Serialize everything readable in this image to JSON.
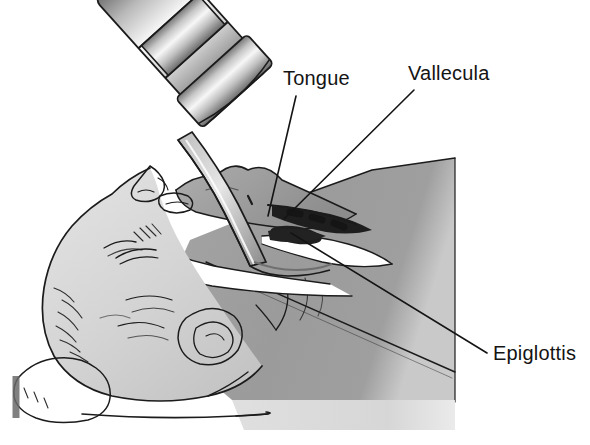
{
  "figure": {
    "background_color": "#ffffff",
    "ink_color": "#1b1b1b",
    "width": 590,
    "height": 445
  },
  "labels": [
    {
      "id": "tongue",
      "text": "Tongue",
      "x": 283,
      "y": 85,
      "leader": {
        "from_x": 296,
        "from_y": 96,
        "to_x": 268,
        "to_y": 216
      }
    },
    {
      "id": "vallecula",
      "text": "Vallecula",
      "x": 408,
      "y": 80,
      "leader": {
        "from_x": 414,
        "from_y": 90,
        "to_x": 284,
        "to_y": 219
      }
    },
    {
      "id": "epiglottis",
      "text": "Epiglottis",
      "x": 493,
      "y": 360,
      "leader": {
        "from_x": 487,
        "from_y": 353,
        "to_x": 291,
        "to_y": 233
      }
    }
  ],
  "anatomy_parts": [
    {
      "id": "head-face",
      "name": "head-and-face",
      "tone": "#d6d6d6"
    },
    {
      "id": "ear",
      "name": "ear",
      "tone": "#d0d0d0"
    },
    {
      "id": "nose",
      "name": "nose",
      "tone": "#cccccc"
    },
    {
      "id": "eye",
      "name": "closed-eye",
      "tone": "#cfcfcf"
    },
    {
      "id": "neck",
      "name": "neck",
      "tone": "#b5b5b5"
    },
    {
      "id": "torso",
      "name": "chest-and-shoulder",
      "tone": "#9a9a9a"
    },
    {
      "id": "tongue-body",
      "name": "tongue",
      "tone": "#9d9d9d"
    },
    {
      "id": "vallecula-pocket",
      "name": "vallecula",
      "tone": "#1e1e1e"
    },
    {
      "id": "epiglottis-flap",
      "name": "epiglottis",
      "tone": "#222222"
    },
    {
      "id": "pharynx-airway",
      "name": "pharyngeal-airway",
      "tone": "#ffffff"
    },
    {
      "id": "pillow",
      "name": "head-pillow",
      "tone": "#f2f2f2"
    }
  ],
  "instrument": {
    "name": "laryngoscope",
    "handle": {
      "name": "laryngoscope-handle",
      "tone_light": "#f4f4f4",
      "tone_dark": "#6e6e6e"
    },
    "blade": {
      "name": "curved-macintosh-blade",
      "tone": "#8e8e8e"
    },
    "segments": 3
  },
  "colors": {
    "ink": "#1b1b1b",
    "skin_light": "#d6d6d6",
    "skin_mid": "#b5b5b5",
    "body_dark": "#9a9a9a",
    "cavity_dark": "#1e1e1e",
    "airway_white": "#ffffff",
    "metal_highlight": "#fafafa",
    "metal_shadow": "#5f5f5f"
  }
}
